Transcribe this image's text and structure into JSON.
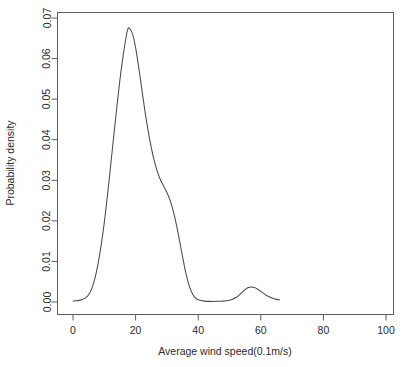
{
  "chart_data": {
    "type": "line",
    "title": "",
    "subtitle": "",
    "xlabel": "Average wind speed(0.1m/s)",
    "ylabel": "Probability density",
    "xlim": [
      0,
      100
    ],
    "ylim": [
      0.0,
      0.07
    ],
    "xticks": [
      0,
      20,
      40,
      60,
      80,
      100
    ],
    "xtick_labels": [
      "0",
      "20",
      "40",
      "60",
      "80",
      "100"
    ],
    "yticks": [
      0.0,
      0.01,
      0.02,
      0.03,
      0.04,
      0.05,
      0.06,
      0.07
    ],
    "ytick_labels": [
      "0.00",
      "0.01",
      "0.02",
      "0.03",
      "0.04",
      "0.05",
      "0.06",
      "0.07"
    ],
    "grid": false,
    "legend": null,
    "legend_position": "none",
    "annotations": [],
    "line_color": "#4a4a4a",
    "axis_color": "#5d5d5d",
    "series": [
      {
        "name": "wind speed density",
        "x": [
          0.0,
          1.0,
          2.0,
          3.0,
          4.0,
          5.0,
          6.0,
          7.0,
          8.0,
          9.0,
          10.0,
          11.0,
          12.0,
          13.0,
          14.0,
          15.0,
          16.0,
          17.0,
          17.5,
          18.0,
          19.0,
          20.0,
          21.0,
          22.0,
          23.0,
          24.0,
          25.0,
          26.0,
          27.0,
          28.0,
          29.0,
          30.0,
          31.0,
          32.0,
          33.0,
          34.0,
          35.0,
          36.0,
          37.0,
          38.0,
          39.0,
          40.0,
          42.0,
          44.0,
          46.0,
          48.0,
          50.0,
          51.0,
          52.0,
          53.0,
          54.0,
          55.0,
          56.0,
          57.0,
          58.0,
          59.0,
          60.0,
          61.0,
          62.0,
          63.0,
          64.0,
          65.0,
          66.0
        ],
        "y": [
          0.00025,
          0.0003,
          0.0004,
          0.0006,
          0.001,
          0.0018,
          0.0033,
          0.0058,
          0.0094,
          0.014,
          0.0196,
          0.0262,
          0.0334,
          0.0408,
          0.048,
          0.0548,
          0.0606,
          0.0655,
          0.0672,
          0.0675,
          0.0661,
          0.0627,
          0.0578,
          0.0524,
          0.047,
          0.0422,
          0.0381,
          0.0347,
          0.032,
          0.03,
          0.0285,
          0.027,
          0.0251,
          0.0225,
          0.0192,
          0.0153,
          0.0112,
          0.0073,
          0.0043,
          0.0023,
          0.0011,
          0.00055,
          0.00022,
          0.00015,
          0.00016,
          0.00022,
          0.00045,
          0.0007,
          0.0011,
          0.00165,
          0.00235,
          0.00305,
          0.00355,
          0.0037,
          0.00355,
          0.00315,
          0.0026,
          0.00205,
          0.00155,
          0.00115,
          0.00085,
          0.00065,
          0.00055
        ]
      }
    ]
  }
}
